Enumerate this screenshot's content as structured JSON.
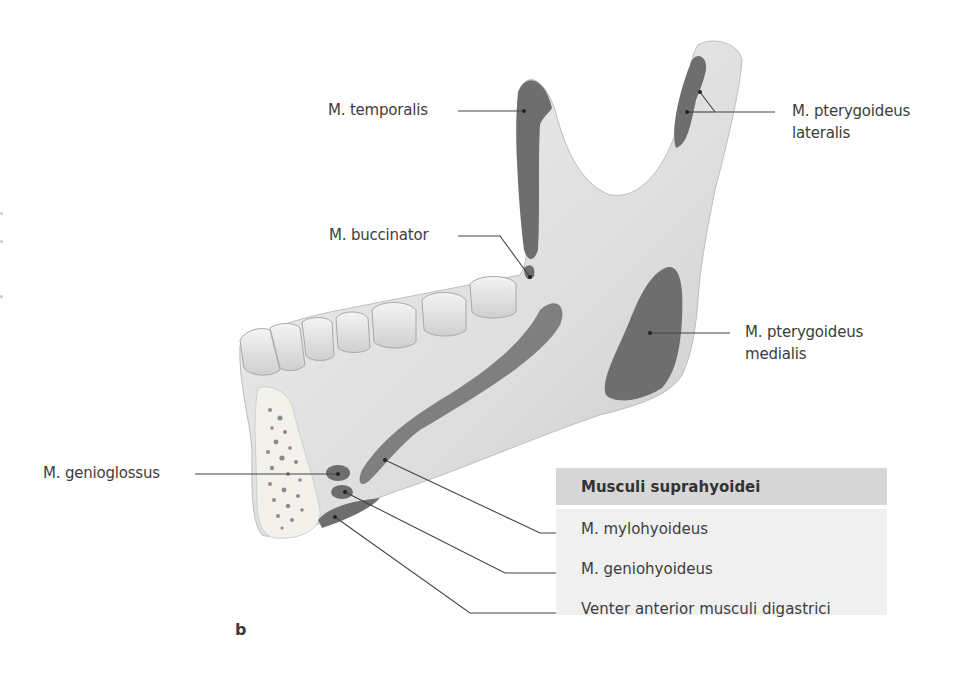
{
  "figure": {
    "letter": "b"
  },
  "labels": {
    "temporalis": "M. temporalis",
    "buccinator": "M. buccinator",
    "pterygoideus_lateralis_line1": "M. pterygoideus",
    "pterygoideus_lateralis_line2": "lateralis",
    "pterygoideus_medialis_line1": "M. pterygoideus",
    "pterygoideus_medialis_line2": "medialis",
    "genioglossus": "M. genioglossus"
  },
  "legend": {
    "title": "Musculi suprahyoidei",
    "items": [
      "M. mylohyoideus",
      "M. geniohyoideus",
      "Venter anterior musculi digastrici"
    ]
  },
  "colors": {
    "bone": "#e4e4e4",
    "bone_shadow": "#c6c6c6",
    "muscle_attachment": "#6e6e6e",
    "leader_line": "#444444",
    "legend_header_bg": "#d7d7d7",
    "legend_body_bg": "#f0f0f0"
  }
}
